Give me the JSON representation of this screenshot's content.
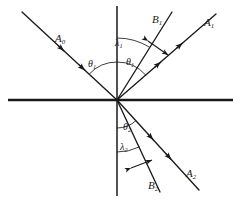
{
  "figure": {
    "kind": "optics-ray-diagram",
    "background_color": "#ffffff",
    "ink_color": "#1a1a1a"
  },
  "axes": {
    "interface_line": {
      "name": "horizontal-interface",
      "x1": 8,
      "y1": 100,
      "x2": 233,
      "y2": 100
    },
    "normal_line": {
      "name": "vertical-normal",
      "x1": 117,
      "y1": 6,
      "x2": 117,
      "y2": 196
    },
    "origin": {
      "x": 117,
      "y": 100
    }
  },
  "rays": [
    {
      "id": "A0",
      "label": "A",
      "subscript": "0",
      "role": "incident-ray",
      "x1": 22,
      "y1": 12,
      "x2": 117,
      "y2": 100,
      "arrow_direction": "toward-origin",
      "arrow_count": 2,
      "label_x": 55,
      "label_y": 33
    },
    {
      "id": "A1",
      "label": "A",
      "subscript": "1",
      "role": "reflected-ray-outer",
      "x1": 117,
      "y1": 100,
      "x2": 216,
      "y2": 14,
      "arrow_direction": "away-from-origin",
      "arrow_count": 2,
      "label_x": 204,
      "label_y": 17
    },
    {
      "id": "B1",
      "label": "B",
      "subscript": "1",
      "role": "reflected-ray-inner",
      "x1": 117,
      "y1": 100,
      "x2": 172,
      "y2": 12,
      "arrow_direction": "away-from-origin",
      "arrow_count": 0,
      "label_x": 152,
      "label_y": 14
    },
    {
      "id": "A2",
      "label": "A",
      "subscript": "2",
      "role": "refracted-ray-outer",
      "x1": 117,
      "y1": 100,
      "x2": 199,
      "y2": 190,
      "arrow_direction": "away-from-origin",
      "arrow_count": 2,
      "label_x": 186,
      "label_y": 168
    },
    {
      "id": "B2",
      "label": "B",
      "subscript": "2",
      "role": "refracted-ray-inner",
      "x1": 117,
      "y1": 100,
      "x2": 160,
      "y2": 192,
      "arrow_direction": "away-from-origin",
      "arrow_count": 0,
      "label_x": 148,
      "label_y": 180
    }
  ],
  "angles": [
    {
      "id": "theta1-incident",
      "label": "θ",
      "subscript": "1",
      "role": "angle-of-incidence",
      "label_x": 88,
      "label_y": 59,
      "arc_radius": 38,
      "arc_from_deg": 90,
      "arc_to_deg": 137
    },
    {
      "id": "theta1-reflected",
      "label": "θ",
      "subscript": "1",
      "role": "angle-of-reflection",
      "label_x": 126,
      "label_y": 57,
      "arc_radius": 38,
      "arc_from_deg": 41,
      "arc_to_deg": 90
    },
    {
      "id": "theta2-refracted",
      "label": "θ",
      "subscript": "2",
      "role": "angle-of-refraction",
      "label_x": 123,
      "label_y": 122,
      "arc_radius": 28,
      "arc_from_deg": 270,
      "arc_to_deg": 313
    }
  ],
  "wavelengths": [
    {
      "id": "lambda1",
      "label": "λ",
      "subscript": "1",
      "role": "wavelength-reflected-medium",
      "label_x": 115,
      "label_y": 38,
      "arc_radius": 62,
      "arc_from_deg": 58,
      "arc_to_deg": 90,
      "marker": {
        "name": "wavelength-spacing-arrow-1",
        "x1": 148,
        "y1": 41,
        "x2": 168,
        "y2": 55
      }
    },
    {
      "id": "lambda2",
      "label": "λ",
      "subscript": "2",
      "role": "wavelength-refracted-medium",
      "label_x": 120,
      "label_y": 142,
      "arc_radius": 52,
      "arc_from_deg": 270,
      "arc_to_deg": 296,
      "marker": {
        "name": "wavelength-spacing-arrow-2",
        "x1": 131,
        "y1": 168,
        "x2": 152,
        "y2": 160
      }
    }
  ]
}
